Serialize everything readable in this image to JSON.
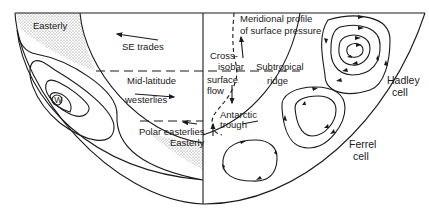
{
  "diagram": {
    "title": "",
    "labels": {
      "easterly_top": "Easterly",
      "se_trades": "SE trades",
      "mid_latitude": "Mid-latitude",
      "westerlies": "westerlies",
      "polar_easterlies": "Polar easterlies",
      "easterly_bottom": "Easterly",
      "w_marker": "W",
      "meridional_1": "Meridional profile",
      "meridional_2": "of surface pressure",
      "cross_1": "Cross-",
      "cross_2": "isobar",
      "cross_3": "surface",
      "cross_4": "flow",
      "subtropical_1": "Subtropical",
      "subtropical_2": "ridge",
      "antarctic_1": "Antarctic",
      "antarctic_2": "trough",
      "hadley_1": "Hadley",
      "hadley_2": "cell",
      "ferrel_1": "Ferrel",
      "ferrel_2": "cell"
    },
    "colors": {
      "ink": "#1a1a1a",
      "background": "#ffffff",
      "stipple": "#6b6b6b"
    }
  }
}
